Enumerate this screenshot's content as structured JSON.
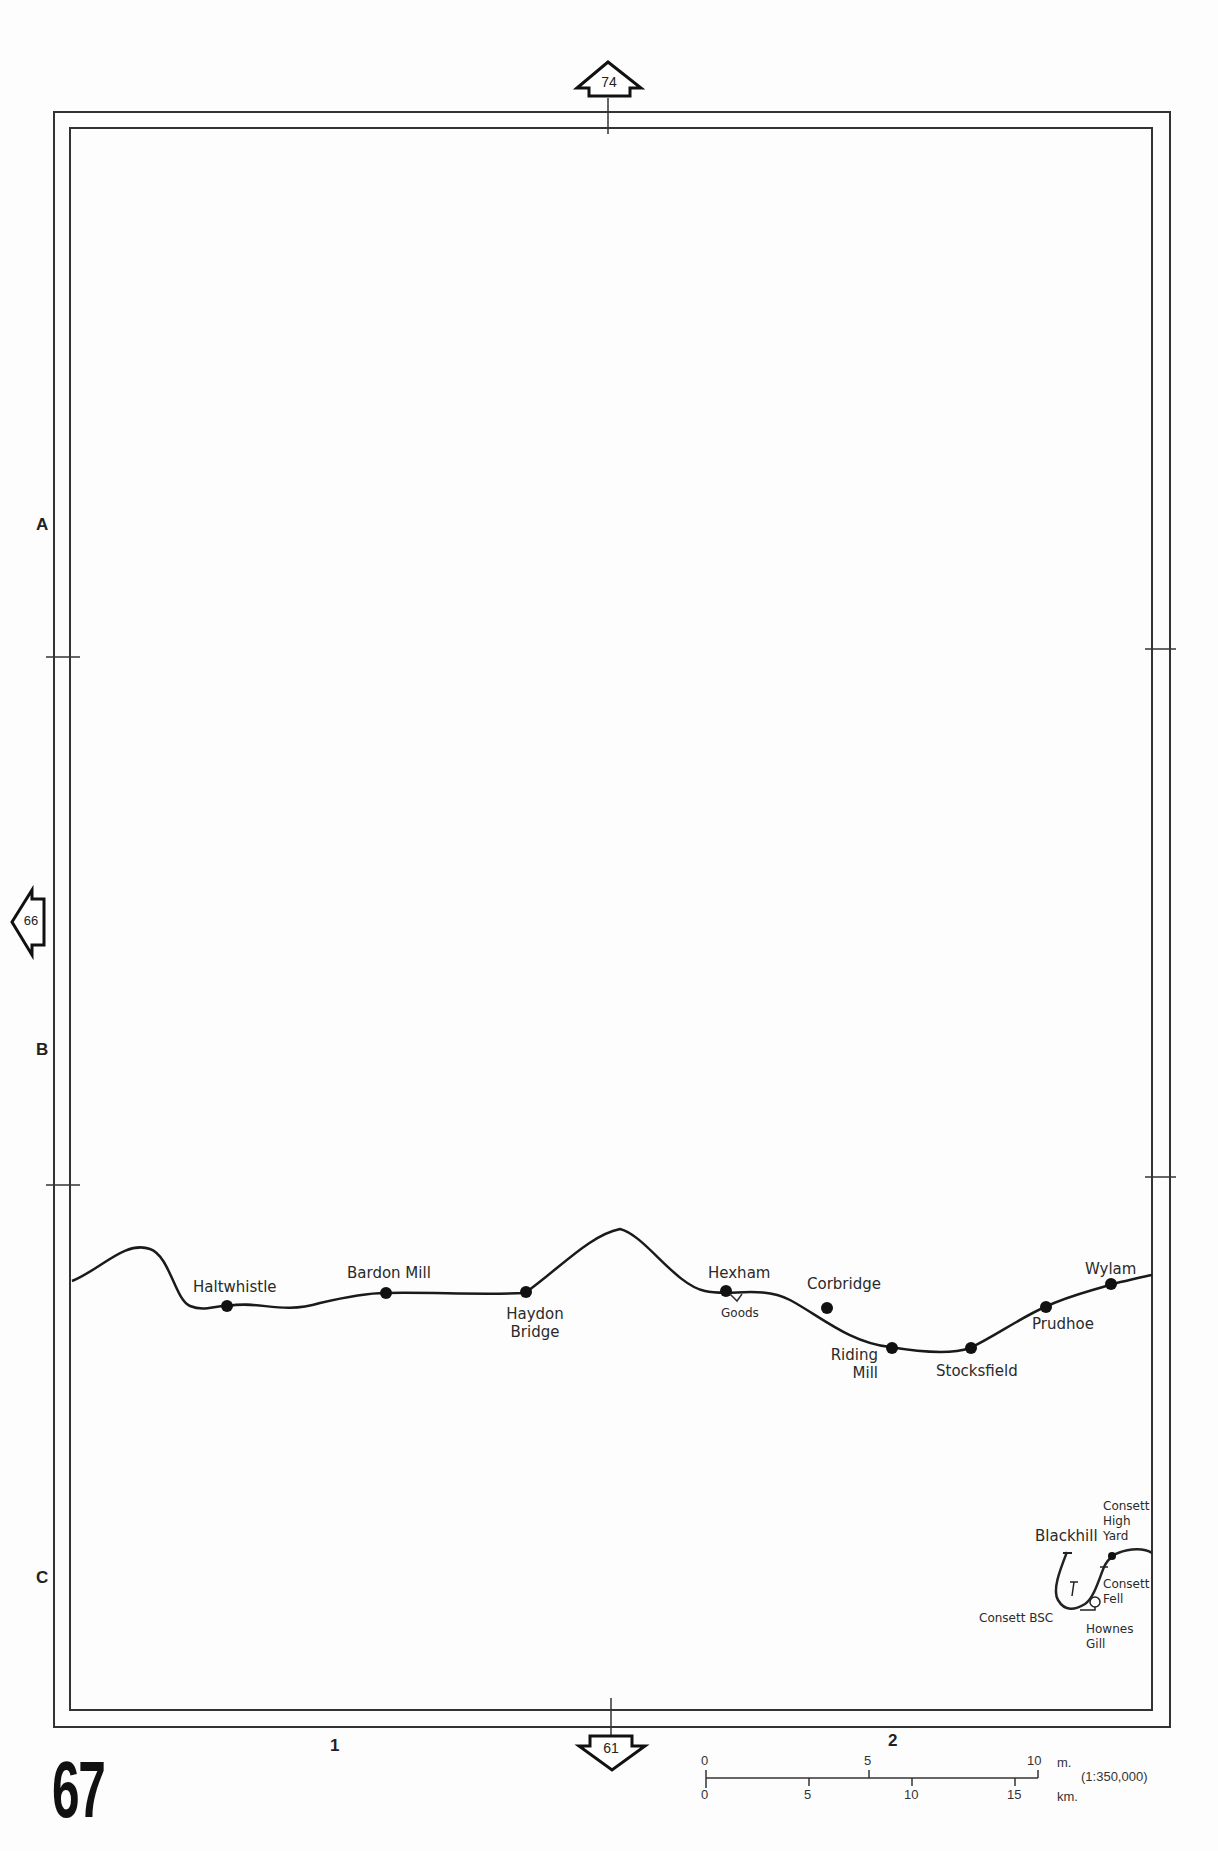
{
  "page": {
    "number": "67"
  },
  "adjacent_pages": {
    "north": "74",
    "west": "66",
    "south": "61"
  },
  "grid": {
    "rows": [
      "A",
      "B",
      "C"
    ],
    "columns": [
      "1",
      "2"
    ]
  },
  "stations": {
    "haltwhistle": "Haltwhistle",
    "bardon_mill": "Bardon Mill",
    "haydon_bridge_1": "Haydon",
    "haydon_bridge_2": "Bridge",
    "hexham": "Hexham",
    "goods": "Goods",
    "corbridge": "Corbridge",
    "riding_mill_1": "Riding",
    "riding_mill_2": "Mill",
    "stocksfield": "Stocksfield",
    "prudhoe": "Prudhoe",
    "wylam": "Wylam",
    "blackhill": "Blackhill",
    "consett_high_yard_1": "Consett",
    "consett_high_yard_2": "High",
    "consett_high_yard_3": "Yard",
    "consett_fell_1": "Consett",
    "consett_fell_2": "Fell",
    "consett_bsc": "Consett BSC",
    "hownes_gill_1": "Hownes",
    "hownes_gill_2": "Gill"
  },
  "scale_bar": {
    "miles_ticks": [
      "0",
      "5",
      "10"
    ],
    "miles_unit": "m.",
    "km_ticks": [
      "0",
      "5",
      "10",
      "15"
    ],
    "km_unit": "km.",
    "ratio": "(1:350,000)"
  },
  "colors": {
    "line": "#1a1a1a",
    "frame": "#333333",
    "paper": "#fdfdfd"
  }
}
